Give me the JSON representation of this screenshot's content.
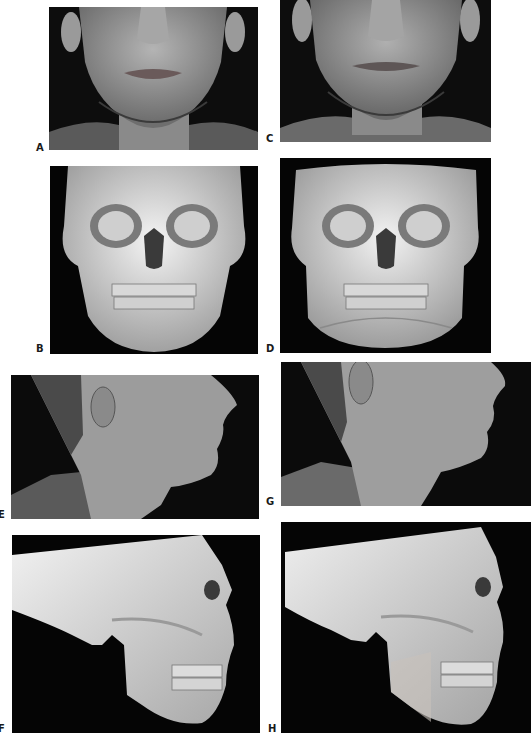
{
  "figure": {
    "panels": [
      {
        "id": "A",
        "label": "A",
        "view": "frontal",
        "type": "clinical-photo"
      },
      {
        "id": "B",
        "label": "B",
        "view": "frontal",
        "type": "3d-ct-skull-render"
      },
      {
        "id": "C",
        "label": "C",
        "view": "frontal",
        "type": "clinical-photo"
      },
      {
        "id": "D",
        "label": "D",
        "view": "frontal",
        "type": "3d-ct-skull-render"
      },
      {
        "id": "E",
        "label": "E",
        "view": "lateral",
        "type": "clinical-photo"
      },
      {
        "id": "F",
        "label": "F",
        "view": "lateral",
        "type": "3d-ct-skull-render"
      },
      {
        "id": "G",
        "label": "G",
        "view": "lateral",
        "type": "clinical-photo"
      },
      {
        "id": "H",
        "label": "H",
        "view": "lateral",
        "type": "3d-ct-skull-render"
      }
    ]
  },
  "colors": {
    "page_bg": "#ffffff",
    "panel_bg": "#0b0b0b",
    "skin": "#9a9a9a",
    "bone": "#e8e8e8",
    "label": "#1a1a1a"
  }
}
